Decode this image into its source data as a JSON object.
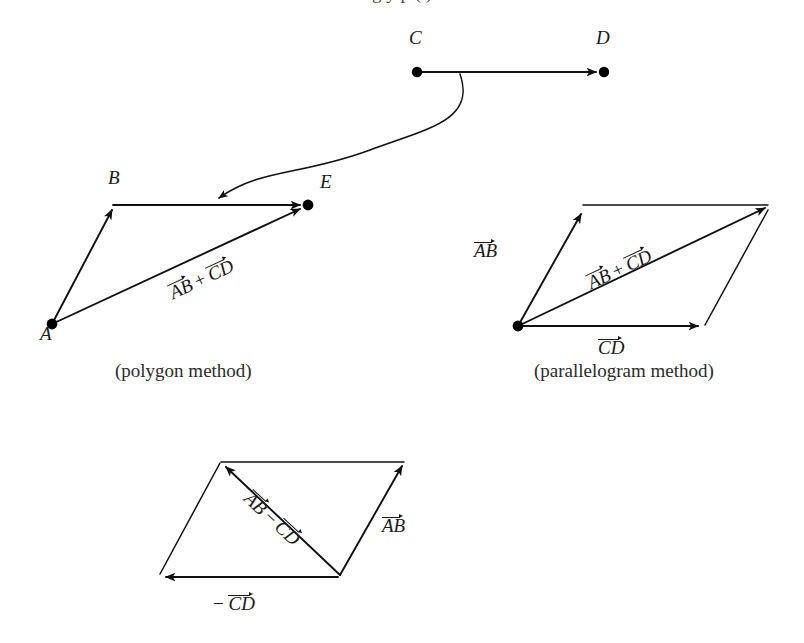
{
  "figure": {
    "background_color": "#ffffff",
    "ink_color": "#111111",
    "clipped_top_line": "g y p ( )",
    "panels": [
      {
        "id": "cd-source",
        "name": "cd-source-vector",
        "points": [
          {
            "label": "C",
            "x": 417,
            "y": 72,
            "label_x": 409,
            "label_y": 38
          },
          {
            "label": "D",
            "x": 604,
            "y": 72,
            "label_x": 596,
            "label_y": 38
          }
        ],
        "vector_label": "CD"
      },
      {
        "id": "polygon",
        "name": "polygon-method-panel",
        "caption": "(polygon method)",
        "caption_x": 115,
        "caption_y": 361,
        "points": [
          {
            "label": "A",
            "x": 52,
            "y": 324,
            "label_x": 40,
            "label_y": 330
          },
          {
            "label": "B",
            "x": 113,
            "y": 206,
            "label_x": 110,
            "label_y": 175
          },
          {
            "label": "E",
            "x": 308,
            "y": 205,
            "label_x": 320,
            "label_y": 179
          }
        ],
        "diagonal_label_parts": [
          "AB",
          "+",
          "CD"
        ]
      },
      {
        "id": "parallelogram",
        "name": "parallelogram-method-panel",
        "caption": "(parallelogram method)",
        "caption_x": 534,
        "caption_y": 361,
        "labels": {
          "side_left": "AB",
          "side_bottom": "CD",
          "diagonal_parts": [
            "AB",
            "+",
            "CD"
          ]
        }
      },
      {
        "id": "subtraction",
        "name": "vector-subtraction-panel",
        "labels": {
          "side_right": "AB",
          "side_bottom": "−CD",
          "diagonal_parts": [
            "AB",
            "−",
            "CD"
          ]
        }
      }
    ]
  }
}
